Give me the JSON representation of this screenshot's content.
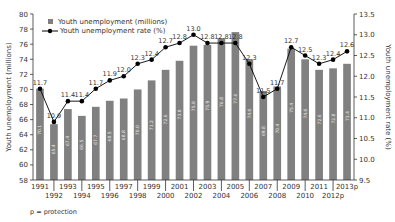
{
  "chart_data": {
    "type": "bar",
    "title": "",
    "categories": [
      "1991",
      "1992",
      "1993",
      "1994",
      "1995",
      "1996",
      "1997",
      "1998",
      "1999",
      "2000",
      "2001",
      "2002",
      "2003",
      "2004",
      "2005",
      "2006",
      "2007",
      "2008",
      "2009",
      "2010",
      "2011",
      "2012p",
      "2013p"
    ],
    "series": [
      {
        "name": "Youth unemployment (millions)",
        "type": "bar",
        "axis": "left",
        "color": "#808080",
        "values": [
          70.1,
          65.4,
          67.4,
          66.5,
          67.7,
          68.5,
          68.8,
          70.0,
          71.2,
          72.6,
          73.8,
          75.8,
          75.9,
          76.8,
          77.6,
          74.0,
          69.8,
          70.4,
          75.4,
          74.0,
          72.6,
          72.8,
          73.4
        ]
      },
      {
        "name": "Youth unemployment rate (%)",
        "type": "line",
        "axis": "right",
        "color": "#000000",
        "values": [
          11.7,
          10.9,
          11.4,
          11.4,
          11.7,
          11.9,
          12.0,
          12.3,
          12.4,
          12.7,
          12.8,
          13.0,
          12.8,
          12.8,
          12.8,
          12.3,
          11.5,
          11.7,
          12.7,
          12.5,
          12.3,
          12.4,
          12.6
        ]
      }
    ],
    "xlabel": "",
    "ylabel": "Youth unemployment (millions)",
    "y2label": "Youth unemployment rate (%)",
    "ylim": [
      58,
      80
    ],
    "y2lim": [
      9.5,
      13.5
    ],
    "yticks": [
      "58",
      "60",
      "62",
      "64",
      "66",
      "68",
      "70",
      "72",
      "74",
      "76",
      "78",
      "80"
    ],
    "y2ticks": [
      "9.5",
      "10.0",
      "10.5",
      "11.0",
      "11.5",
      "12.0",
      "12.5",
      "13.0",
      "13.5"
    ],
    "legend_position": "top-left",
    "grid": false,
    "footnote": "p = protection"
  }
}
